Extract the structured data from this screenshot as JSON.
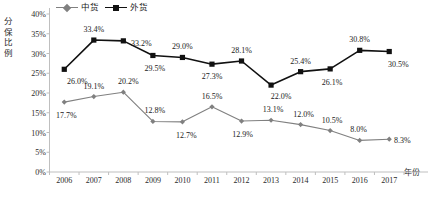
{
  "chart_data": {
    "type": "line",
    "title": "",
    "xlabel": "年份",
    "ylabel": "分保比例",
    "categories": [
      "2006",
      "2007",
      "2008",
      "2009",
      "2010",
      "2011",
      "2012",
      "2013",
      "2014",
      "2015",
      "2016",
      "2017"
    ],
    "ylim": [
      0,
      40
    ],
    "ytick_labels": [
      "0%",
      "5%",
      "10%",
      "15%",
      "20%",
      "25%",
      "30%",
      "35%",
      "40%"
    ],
    "ytick_values": [
      0,
      5,
      10,
      15,
      20,
      25,
      30,
      35,
      40
    ],
    "grid": false,
    "legend_position": "top-left",
    "series": [
      {
        "name": "中货",
        "color": "#808080",
        "marker": "diamond",
        "values": [
          17.7,
          19.1,
          20.2,
          12.8,
          12.7,
          16.5,
          12.9,
          13.1,
          12.0,
          10.5,
          8.0,
          8.3
        ],
        "data_labels": [
          "17.7%",
          "19.1%",
          "20.2%",
          "12.8%",
          "12.7%",
          "16.5%",
          "12.9%",
          "13.1%",
          "12.0%",
          "10.5%",
          "8.0%",
          "8.3%"
        ]
      },
      {
        "name": "外货",
        "color": "#111111",
        "marker": "square",
        "values": [
          26.0,
          33.4,
          33.2,
          29.5,
          29.0,
          27.3,
          28.1,
          22.0,
          25.4,
          26.1,
          30.8,
          30.5
        ],
        "data_labels": [
          "26.0%",
          "33.4%",
          "33.2%",
          "29.5%",
          "29.0%",
          "27.3%",
          "28.1%",
          "22.0%",
          "25.4%",
          "26.1%",
          "30.8%",
          "30.5%"
        ]
      }
    ]
  },
  "legend": {
    "entries": [
      {
        "label": "中货"
      },
      {
        "label": "外货"
      }
    ]
  },
  "axis": {
    "y_title_chars": [
      "分",
      "保",
      "比",
      "例"
    ],
    "x_title": "年份"
  }
}
